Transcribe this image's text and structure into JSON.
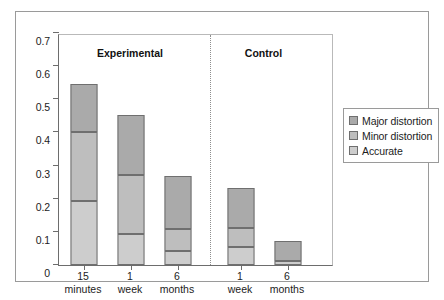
{
  "chart_data": {
    "type": "bar",
    "subtype": "stacked-bar",
    "title": "",
    "xlabel": "",
    "ylabel": "",
    "ylim": [
      0,
      0.7
    ],
    "y_ticks": [
      "0",
      "0.1",
      "0.2",
      "0.3",
      "0.4",
      "0.5",
      "0.6",
      "0.7"
    ],
    "y_tick_values": [
      0,
      0.1,
      0.2,
      0.3,
      0.4,
      0.5,
      0.6,
      0.7
    ],
    "grid": false,
    "legend_position": "right",
    "categories": [
      "15 minutes",
      "1 week",
      "6 months",
      "1 week",
      "6 months"
    ],
    "category_lines": [
      [
        "15",
        "minutes"
      ],
      [
        "1",
        "week"
      ],
      [
        "6",
        "months"
      ],
      [
        "1",
        "week"
      ],
      [
        "6",
        "months"
      ]
    ],
    "group_labels": [
      "Experimental",
      "Control"
    ],
    "group_spans": [
      [
        0,
        2
      ],
      [
        3,
        4
      ]
    ],
    "series": [
      {
        "name": "Accurate",
        "color": "#cdcdcd",
        "values": [
          0.193,
          0.095,
          0.043,
          0.055,
          0.013
        ]
      },
      {
        "name": "Minor distortion",
        "color": "#bebebe",
        "values": [
          0.207,
          0.177,
          0.067,
          0.058,
          0.0
        ]
      },
      {
        "name": "Major distortion",
        "color": "#aaaaaa",
        "values": [
          0.145,
          0.18,
          0.16,
          0.12,
          0.06
        ]
      }
    ],
    "cumulative_tops": [
      [
        0.193,
        0.4,
        0.545
      ],
      [
        0.095,
        0.272,
        0.452
      ],
      [
        0.043,
        0.11,
        0.27
      ],
      [
        0.055,
        0.113,
        0.233
      ],
      [
        0.013,
        0.013,
        0.073
      ]
    ],
    "totals": [
      0.545,
      0.452,
      0.27,
      0.233,
      0.073
    ]
  },
  "legend": {
    "items": [
      {
        "label": "Major distortion",
        "color": "#aaaaaa"
      },
      {
        "label": "Minor distortion",
        "color": "#bebebe"
      },
      {
        "label": "Accurate",
        "color": "#cdcdcd"
      }
    ]
  },
  "colors": {
    "axis": "#6d6d6d",
    "frame": "#9a9a9a",
    "bar_outline": "#6f6f6f",
    "divider": "#8e8e8e",
    "text": "#1c1c1c",
    "background": "#ffffff"
  }
}
